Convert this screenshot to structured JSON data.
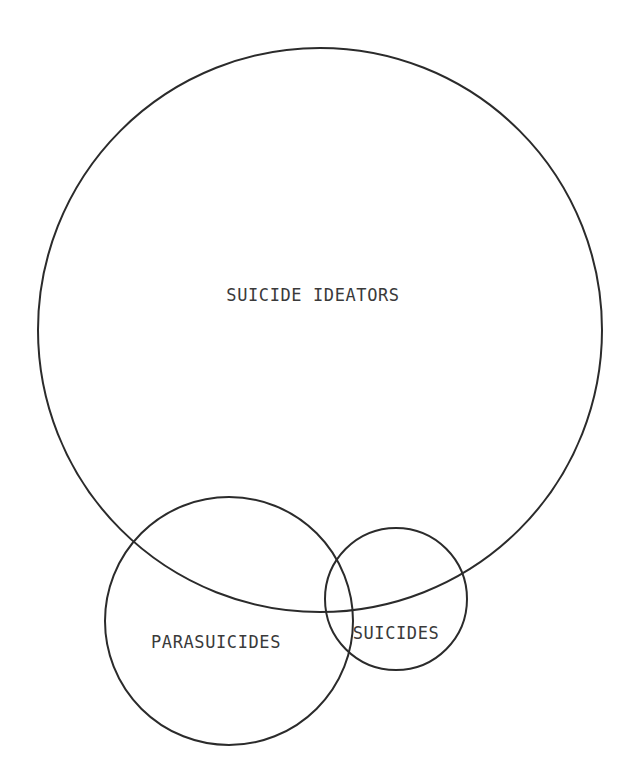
{
  "figure": {
    "type": "venn-diagram",
    "title": "",
    "background_color": "#ffffff",
    "stroke_color": "#2b2b2b",
    "label_color": "#3a3a3a",
    "stroke_width": 2,
    "canvas": {
      "width": 630,
      "height": 780
    }
  },
  "chart_data": {
    "type": "diagram",
    "subtype": "venn",
    "title": "",
    "xlabel": "",
    "ylabel": "",
    "grid": false,
    "legend": "none",
    "sets": [
      {
        "id": "suicide-ideators",
        "label": "SUICIDE IDEATORS",
        "cx": 320,
        "cy": 330,
        "r": 282,
        "label_x": 313,
        "label_y": 296,
        "relative_size": "largest",
        "overlaps": [
          "parasuicides",
          "suicides"
        ]
      },
      {
        "id": "parasuicides",
        "label": "PARASUICIDES",
        "cx": 229,
        "cy": 621,
        "r": 124,
        "label_x": 216,
        "label_y": 643,
        "relative_size": "medium",
        "overlaps": [
          "suicide-ideators",
          "suicides"
        ]
      },
      {
        "id": "suicides",
        "label": "SUICIDES",
        "cx": 396,
        "cy": 599,
        "r": 71,
        "label_x": 396,
        "label_y": 634,
        "relative_size": "smallest",
        "overlaps": [
          "suicide-ideators",
          "parasuicides"
        ]
      }
    ],
    "annotations": []
  }
}
